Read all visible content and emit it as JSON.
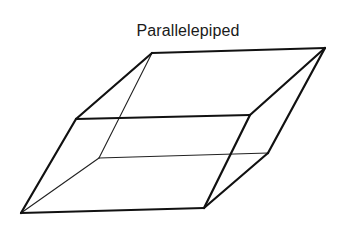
{
  "diagram": {
    "title": "Parallelepiped",
    "shape": "parallelepiped",
    "colors": {
      "line": "#111111",
      "background": "#ffffff"
    },
    "vertices": {
      "top_back_left": [
        152,
        53
      ],
      "top_back_right": [
        325,
        48
      ],
      "top_front_left": [
        76,
        119
      ],
      "top_front_right": [
        250,
        115
      ],
      "bottom_back_left": [
        99,
        158
      ],
      "bottom_back_right": [
        268,
        153
      ],
      "bottom_front_left": [
        21,
        213
      ],
      "bottom_front_right": [
        204,
        208
      ]
    },
    "visible_edges": [
      [
        "top_back_left",
        "top_back_right"
      ],
      [
        "top_back_left",
        "top_front_left"
      ],
      [
        "top_front_left",
        "top_front_right"
      ],
      [
        "top_front_right",
        "top_back_right"
      ],
      [
        "top_front_left",
        "bottom_front_left"
      ],
      [
        "top_front_right",
        "bottom_front_right"
      ],
      [
        "top_back_right",
        "bottom_back_right"
      ],
      [
        "bottom_front_left",
        "bottom_front_right"
      ],
      [
        "bottom_front_right",
        "bottom_back_right"
      ]
    ],
    "hidden_edges": [
      [
        "top_back_left",
        "bottom_back_left"
      ],
      [
        "bottom_back_left",
        "bottom_back_right"
      ],
      [
        "bottom_back_left",
        "bottom_front_left"
      ]
    ]
  }
}
